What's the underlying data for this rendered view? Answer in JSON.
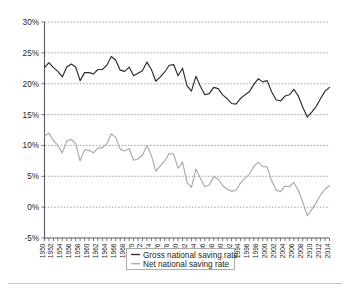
{
  "chart_data": {
    "type": "line",
    "title": "",
    "subtitle": "",
    "xlabel": "",
    "ylabel": "",
    "grid": true,
    "legend_position": "bottom-center",
    "ylim": [
      -5,
      30
    ],
    "ytick_labels": [
      "30%",
      "25%",
      "20%",
      "15%",
      "10%",
      "5%",
      "0%",
      "-5%"
    ],
    "ytick_values": [
      30,
      25,
      20,
      15,
      10,
      5,
      0,
      -5
    ],
    "xlim": [
      1950,
      2014
    ],
    "xtick_labels": [
      "1950",
      "1952",
      "1954",
      "1956",
      "1958",
      "1960",
      "1962",
      "1964",
      "1966",
      "1968",
      "1970",
      "1972",
      "1974",
      "1976",
      "1978",
      "1980",
      "1982",
      "1984",
      "1986",
      "1988",
      "1990",
      "1992",
      "1994",
      "1996",
      "1998",
      "2000",
      "2002",
      "2004",
      "2006",
      "2008",
      "2010",
      "2012",
      "2014"
    ],
    "x": [
      1950,
      1951,
      1952,
      1953,
      1954,
      1955,
      1956,
      1957,
      1958,
      1959,
      1960,
      1961,
      1962,
      1963,
      1964,
      1965,
      1966,
      1967,
      1968,
      1969,
      1970,
      1971,
      1972,
      1973,
      1974,
      1975,
      1976,
      1977,
      1978,
      1979,
      1980,
      1981,
      1982,
      1983,
      1984,
      1985,
      1986,
      1987,
      1988,
      1989,
      1990,
      1991,
      1992,
      1993,
      1994,
      1995,
      1996,
      1997,
      1998,
      1999,
      2000,
      2001,
      2002,
      2003,
      2004,
      2005,
      2006,
      2007,
      2008,
      2009,
      2010,
      2011,
      2012,
      2013,
      2014
    ],
    "series": [
      {
        "name": "Gross national saving rate",
        "color": "#2b2b2b",
        "values": [
          22.6,
          23.4,
          22.6,
          22.0,
          21.1,
          22.7,
          23.2,
          22.7,
          20.5,
          21.8,
          21.8,
          21.6,
          22.3,
          22.3,
          23.0,
          24.4,
          23.8,
          22.2,
          22.0,
          22.7,
          21.3,
          21.7,
          22.1,
          23.5,
          22.3,
          20.4,
          21.1,
          21.9,
          23.0,
          23.1,
          21.3,
          22.5,
          19.7,
          18.8,
          21.2,
          19.6,
          18.2,
          18.4,
          19.4,
          19.2,
          18.2,
          17.6,
          16.8,
          16.7,
          17.6,
          18.2,
          18.7,
          19.9,
          20.8,
          20.3,
          20.5,
          18.7,
          17.4,
          17.2,
          18.0,
          18.2,
          19.1,
          18.0,
          16.2,
          14.6,
          15.4,
          16.3,
          17.6,
          18.8,
          19.4
        ]
      },
      {
        "name": "Net national saving rate",
        "color": "#a7a9ac",
        "values": [
          11.5,
          12.0,
          10.8,
          10.0,
          8.8,
          10.7,
          11.0,
          10.3,
          7.5,
          9.3,
          9.2,
          8.8,
          9.6,
          9.6,
          10.3,
          11.9,
          11.3,
          9.4,
          9.1,
          9.5,
          7.6,
          7.8,
          8.4,
          10.0,
          8.4,
          5.8,
          6.7,
          7.5,
          8.7,
          8.6,
          6.3,
          7.3,
          4.0,
          3.2,
          6.2,
          4.7,
          3.3,
          3.6,
          4.9,
          4.6,
          3.5,
          2.9,
          2.6,
          2.7,
          3.9,
          4.7,
          5.3,
          6.6,
          7.3,
          6.6,
          6.5,
          4.3,
          2.8,
          2.5,
          3.4,
          3.3,
          4.0,
          2.7,
          0.8,
          -1.4,
          -0.4,
          0.7,
          2.0,
          2.9,
          3.5
        ]
      }
    ],
    "legend": [
      {
        "label": "Gross national saving rate",
        "color": "#2b2b2b"
      },
      {
        "label": "Net national saving rate",
        "color": "#a7a9ac"
      }
    ]
  }
}
